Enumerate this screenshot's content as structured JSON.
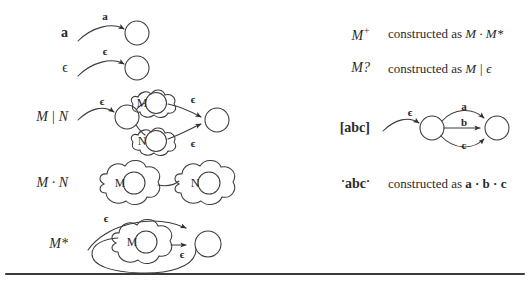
{
  "figure": {
    "background_color": "#ffffff",
    "ink_color": "#2a2a2a",
    "divider": {
      "present": true,
      "color": "#3a3a3a"
    }
  },
  "left_column": {
    "rows": [
      {
        "id": "row-a",
        "label": "a",
        "label_style": "bold-upright",
        "diagram": "single-state-with-incoming-labeled-arrow",
        "edge_labels": [
          "a"
        ],
        "states": 1
      },
      {
        "id": "row-epsilon",
        "label": "ϵ",
        "label_style": "upright",
        "diagram": "single-state-with-incoming-labeled-arrow",
        "edge_labels": [
          "ϵ"
        ],
        "states": 1
      },
      {
        "id": "row-alternation",
        "label": "M | N",
        "label_style": "italic",
        "diagram": "alternation-split-join",
        "edge_labels": [
          "ϵ",
          "ϵ",
          "ϵ"
        ],
        "blob_labels": [
          "M",
          "N"
        ],
        "states": 2
      },
      {
        "id": "row-concatenation",
        "label": "M · N",
        "label_style": "italic",
        "diagram": "concatenation-two-blobs",
        "edge_labels": [],
        "blob_labels": [
          "M",
          "N"
        ],
        "states": 0
      },
      {
        "id": "row-star",
        "label": "M*",
        "label_style": "italic",
        "diagram": "kleene-star-loop",
        "edge_labels": [
          "ϵ",
          "ϵ"
        ],
        "blob_labels": [
          "M"
        ],
        "states": 1
      }
    ]
  },
  "right_column": {
    "rows": [
      {
        "id": "row-plus",
        "label": "M",
        "label_superscript": "+",
        "label_style": "italic",
        "description_prefix": "constructed as",
        "description_expr": "M · M*",
        "kind": "text"
      },
      {
        "id": "row-optional",
        "label": "M?",
        "label_style": "italic",
        "description_prefix": "constructed as",
        "description_expr": "M | ϵ",
        "kind": "text"
      },
      {
        "id": "row-charclass",
        "label": "[abc]",
        "label_style": "bold-upright",
        "kind": "diagram",
        "diagram": "character-class-three-parallel-edges",
        "edge_labels": [
          "ϵ",
          "a",
          "b",
          "c"
        ],
        "states": 2
      },
      {
        "id": "row-string",
        "label": "abc",
        "label_quote": "·",
        "label_style": "bold-upright-quoted",
        "description_prefix": "constructed as",
        "description_expr": "a · b · c",
        "kind": "text"
      }
    ]
  }
}
